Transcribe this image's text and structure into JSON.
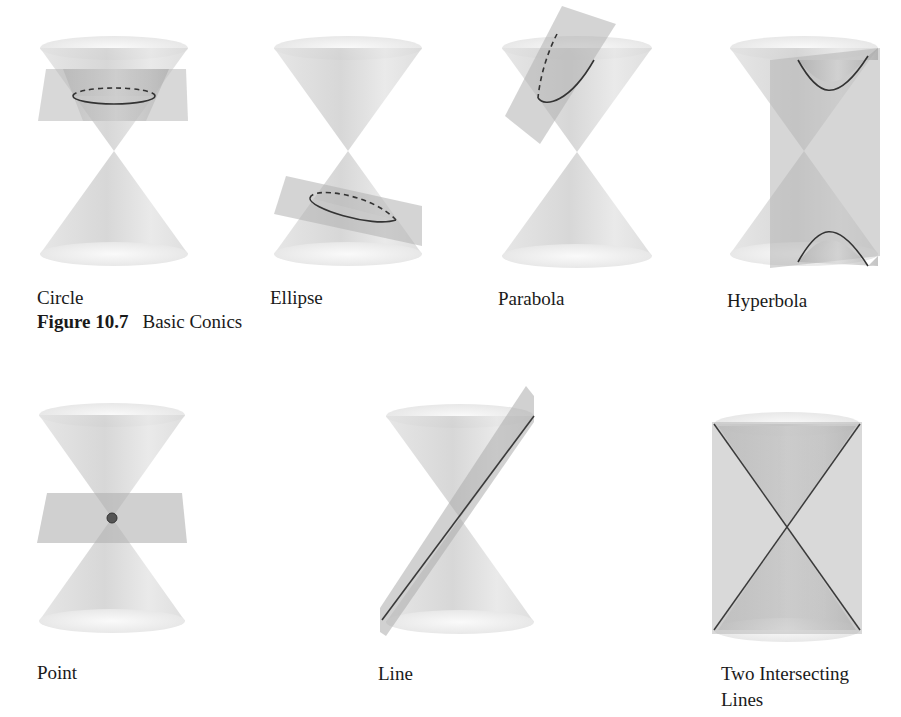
{
  "figure": {
    "number": "Figure 10.7",
    "title": "Basic Conics"
  },
  "panels": [
    {
      "id": "circle",
      "label": "Circle",
      "section": "basic"
    },
    {
      "id": "ellipse",
      "label": "Ellipse",
      "section": "basic"
    },
    {
      "id": "parabola",
      "label": "Parabola",
      "section": "basic"
    },
    {
      "id": "hyperbola",
      "label": "Hyperbola",
      "section": "basic"
    },
    {
      "id": "point",
      "label": "Point",
      "section": "degenerate"
    },
    {
      "id": "line",
      "label": "Line",
      "section": "degenerate"
    },
    {
      "id": "two-lines",
      "label": "Two Intersecting",
      "label_line2": "Lines",
      "section": "degenerate"
    }
  ],
  "colors": {
    "cone_fill": "#d6d6d6",
    "cone_rim": "#eeeeee",
    "plane_fill": "#bdbdbd",
    "curve_stroke": "#3a3a3a",
    "text": "#1a1a1a"
  }
}
